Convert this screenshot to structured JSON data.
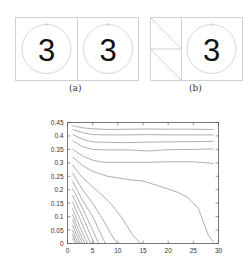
{
  "panels": {
    "a": {
      "caption": "(a)",
      "digits": [
        "3",
        "3"
      ]
    },
    "b": {
      "caption": "(b)",
      "digits": [
        "3"
      ]
    }
  },
  "colors": {
    "frame": "#cfcfcf",
    "circle": "#d4d4d4",
    "digit": "#111111",
    "curve": "#9a9a9a",
    "axis": "#444444",
    "tick_label": "#333333"
  },
  "chart_data": {
    "type": "line",
    "title": "",
    "xlabel": "",
    "ylabel": "",
    "xlim": [
      0,
      30
    ],
    "ylim": [
      0,
      0.45
    ],
    "xticks": [
      "0",
      "5",
      "10",
      "15",
      "20",
      "25",
      "30"
    ],
    "yticks": [
      "0",
      "0.05",
      "0.1",
      "0.15",
      "0.2",
      "0.25",
      "0.3",
      "0.35",
      "0.4",
      "0.45"
    ],
    "grid": false,
    "legend": null,
    "series": [
      {
        "name": "c1",
        "x": [
          1,
          3,
          5,
          8,
          12,
          16,
          20,
          25,
          29
        ],
        "y": [
          0.438,
          0.43,
          0.427,
          0.424,
          0.425,
          0.426,
          0.425,
          0.425,
          0.424
        ]
      },
      {
        "name": "c2",
        "x": [
          1,
          3,
          5,
          8,
          12,
          16,
          20,
          25,
          29
        ],
        "y": [
          0.424,
          0.412,
          0.405,
          0.404,
          0.404,
          0.405,
          0.404,
          0.404,
          0.404
        ]
      },
      {
        "name": "c3",
        "x": [
          1,
          3,
          5,
          8,
          12,
          16,
          20,
          25,
          29
        ],
        "y": [
          0.405,
          0.388,
          0.378,
          0.376,
          0.375,
          0.377,
          0.378,
          0.379,
          0.38
        ]
      },
      {
        "name": "c4",
        "x": [
          1,
          3,
          5,
          8,
          12,
          16,
          20,
          25,
          29
        ],
        "y": [
          0.382,
          0.36,
          0.35,
          0.348,
          0.348,
          0.344,
          0.349,
          0.35,
          0.352
        ]
      },
      {
        "name": "c5",
        "x": [
          1,
          3,
          5,
          7,
          12,
          16,
          20,
          25,
          29
        ],
        "y": [
          0.352,
          0.325,
          0.31,
          0.302,
          0.302,
          0.302,
          0.304,
          0.304,
          0.298
        ]
      },
      {
        "name": "c6",
        "x": [
          1,
          3,
          5,
          8,
          12,
          15,
          18,
          22,
          24,
          26,
          27,
          28,
          29
        ],
        "y": [
          0.322,
          0.29,
          0.268,
          0.25,
          0.238,
          0.232,
          0.215,
          0.19,
          0.17,
          0.13,
          0.08,
          0.03,
          0.005
        ]
      },
      {
        "name": "c7",
        "x": [
          1,
          3,
          5,
          7,
          9,
          11,
          13,
          14.5
        ],
        "y": [
          0.292,
          0.245,
          0.21,
          0.178,
          0.14,
          0.09,
          0.03,
          0.0
        ]
      },
      {
        "name": "c8",
        "x": [
          1,
          3,
          5,
          7,
          8.5,
          9.8
        ],
        "y": [
          0.262,
          0.2,
          0.15,
          0.09,
          0.04,
          0.0
        ]
      },
      {
        "name": "c9",
        "x": [
          1,
          3,
          5,
          6.5,
          7.5
        ],
        "y": [
          0.232,
          0.16,
          0.1,
          0.04,
          0.0
        ]
      },
      {
        "name": "c10",
        "x": [
          1,
          3,
          5,
          6.2
        ],
        "y": [
          0.205,
          0.13,
          0.05,
          0.0
        ]
      },
      {
        "name": "c11",
        "x": [
          1,
          3,
          4.5,
          5.3
        ],
        "y": [
          0.18,
          0.1,
          0.035,
          0.0
        ]
      },
      {
        "name": "c12",
        "x": [
          1,
          2.5,
          4,
          4.6
        ],
        "y": [
          0.155,
          0.09,
          0.025,
          0.0
        ]
      },
      {
        "name": "c13",
        "x": [
          1,
          2.5,
          3.6,
          4.0
        ],
        "y": [
          0.13,
          0.06,
          0.015,
          0.0
        ]
      },
      {
        "name": "c14",
        "x": [
          1,
          2.2,
          3.2,
          3.5
        ],
        "y": [
          0.108,
          0.05,
          0.01,
          0.0
        ]
      },
      {
        "name": "c15",
        "x": [
          1,
          2,
          2.8,
          3.0
        ],
        "y": [
          0.088,
          0.04,
          0.008,
          0.0
        ]
      },
      {
        "name": "c16",
        "x": [
          1,
          1.8,
          2.4,
          2.6
        ],
        "y": [
          0.068,
          0.03,
          0.006,
          0.0
        ]
      },
      {
        "name": "c17",
        "x": [
          1,
          1.6,
          2.1,
          2.3
        ],
        "y": [
          0.05,
          0.02,
          0.004,
          0.0
        ]
      },
      {
        "name": "c18",
        "x": [
          1,
          1.5,
          1.9,
          2.0
        ],
        "y": [
          0.034,
          0.012,
          0.002,
          0.0
        ]
      },
      {
        "name": "c19",
        "x": [
          1,
          1.4,
          1.7
        ],
        "y": [
          0.02,
          0.006,
          0.0
        ]
      }
    ]
  }
}
